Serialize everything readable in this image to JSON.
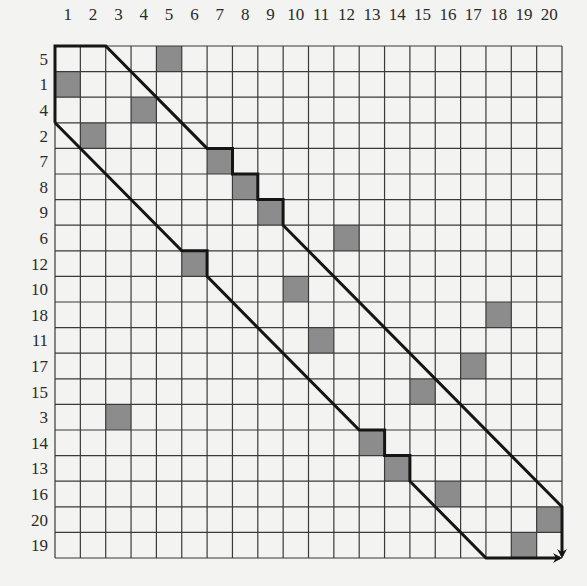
{
  "diagram": {
    "type": "permutation-matrix-grid",
    "grid": {
      "rows": 20,
      "cols": 20
    },
    "column_labels": [
      "1",
      "2",
      "3",
      "4",
      "5",
      "6",
      "7",
      "8",
      "9",
      "10",
      "11",
      "12",
      "13",
      "14",
      "15",
      "16",
      "17",
      "18",
      "19",
      "20"
    ],
    "row_labels": [
      "5",
      "1",
      "4",
      "2",
      "7",
      "8",
      "9",
      "6",
      "12",
      "10",
      "18",
      "11",
      "17",
      "15",
      "3",
      "14",
      "13",
      "16",
      "20",
      "19"
    ],
    "shaded_cells": [
      {
        "row": 0,
        "col": 5
      },
      {
        "row": 1,
        "col": 1
      },
      {
        "row": 2,
        "col": 4
      },
      {
        "row": 3,
        "col": 2
      },
      {
        "row": 4,
        "col": 7
      },
      {
        "row": 5,
        "col": 8
      },
      {
        "row": 6,
        "col": 9
      },
      {
        "row": 7,
        "col": 12
      },
      {
        "row": 8,
        "col": 6
      },
      {
        "row": 9,
        "col": 10
      },
      {
        "row": 10,
        "col": 18
      },
      {
        "row": 11,
        "col": 11
      },
      {
        "row": 12,
        "col": 17
      },
      {
        "row": 13,
        "col": 15
      },
      {
        "row": 14,
        "col": 3
      },
      {
        "row": 15,
        "col": 13
      },
      {
        "row": 16,
        "col": 14
      },
      {
        "row": 17,
        "col": 16
      },
      {
        "row": 18,
        "col": 20
      },
      {
        "row": 19,
        "col": 19
      }
    ],
    "paths": {
      "upper": "start top-left, right along top to col 2, diagonal to cell (row 7, col 7), staircase around cells 7,8,9, diagonal to right edge at row 20, down to bottom-right with arrow",
      "lower": "start left edge at row 2, diagonal to cell (row 12, col 6), around it, diagonal to cell (row 14, col 13), staircase around 13,14, diagonal to bottom at col 17, right along bottom with arrow"
    },
    "colors": {
      "background": "#f3f3f1",
      "grid_line": "#3a3a3a",
      "shaded": "#8c8c8c",
      "path": "#151515"
    }
  }
}
